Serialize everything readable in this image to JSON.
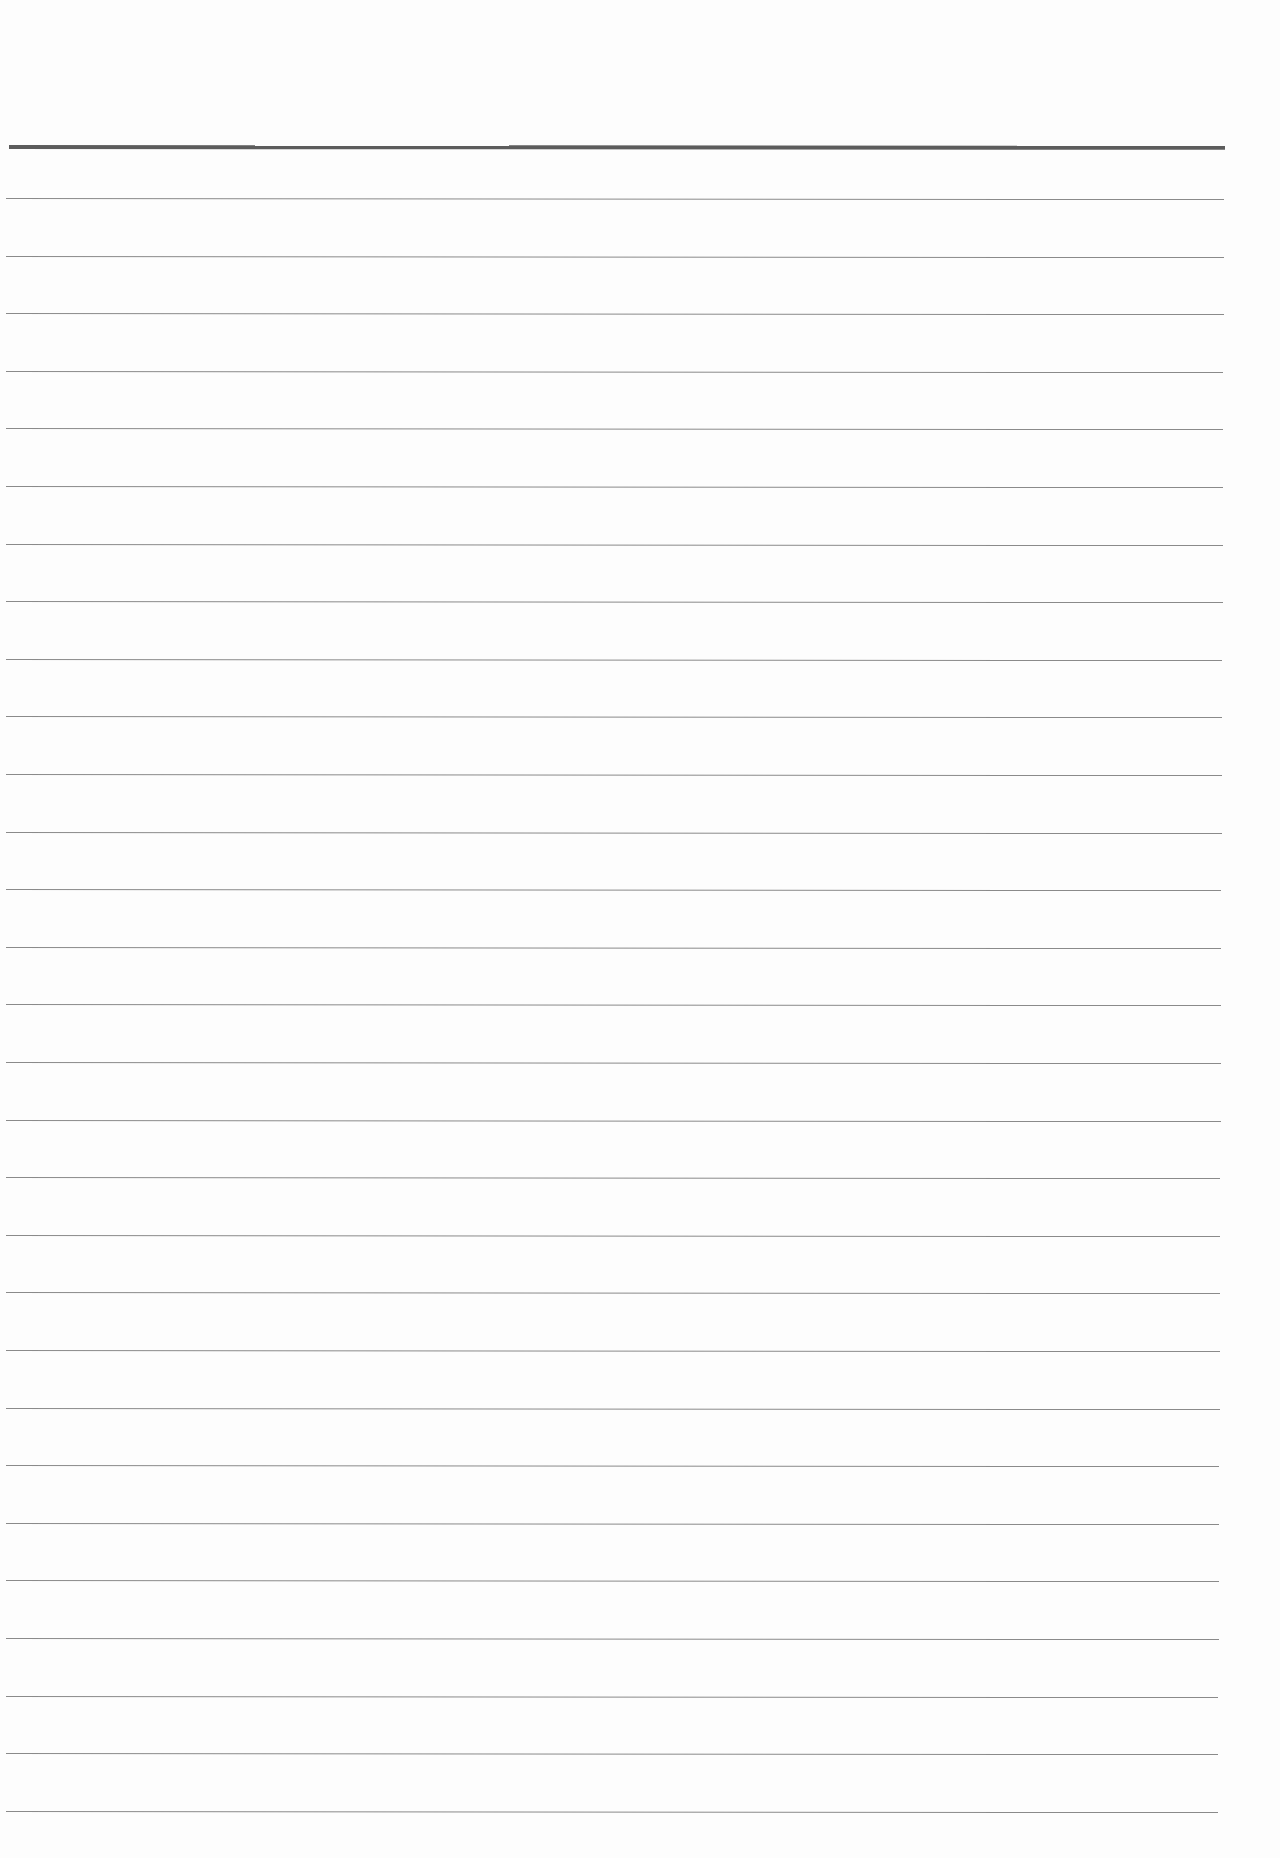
{
  "page": {
    "type": "blank ruled paper",
    "text": ""
  },
  "header_rule": {
    "top": 145,
    "left": 9,
    "width": 1216,
    "color": "#5c5c5c"
  },
  "rules": {
    "count": 29,
    "first_top": 198,
    "spacing": 57.6,
    "left": 6,
    "width_top": 1218,
    "width_bottom": 1212,
    "color": "#8a8a8a"
  }
}
